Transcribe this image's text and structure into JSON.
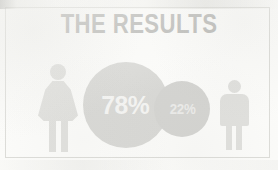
{
  "graphic": {
    "kind": "infographic-card",
    "title": "THE RESULTS",
    "background_color": "#fbfbf9",
    "frame_color": "#dcdcd8",
    "title_color": "#b9b9b6"
  },
  "figures": {
    "female": {
      "icon": "female-figure-icon",
      "color": "#e0e0dd",
      "position": "left"
    },
    "male": {
      "icon": "male-figure-icon",
      "color": "#e0e0dd",
      "position": "right"
    }
  },
  "bubbles": {
    "major": {
      "label": "78%",
      "color": "#d8d8d5",
      "text_color": "#f4f4f2"
    },
    "minor": {
      "label": "22%",
      "color": "#d4d4d1",
      "text_color": "#ebebe9"
    }
  },
  "chart_data": {
    "type": "pie",
    "title": "THE RESULTS",
    "subtitle": "",
    "xlabel": "",
    "ylabel": "",
    "categories": [
      "Female",
      "Male"
    ],
    "values": [
      78,
      22
    ],
    "labels": [
      "78%",
      "22%"
    ],
    "units": "percent",
    "legend": "none",
    "grid": false
  }
}
